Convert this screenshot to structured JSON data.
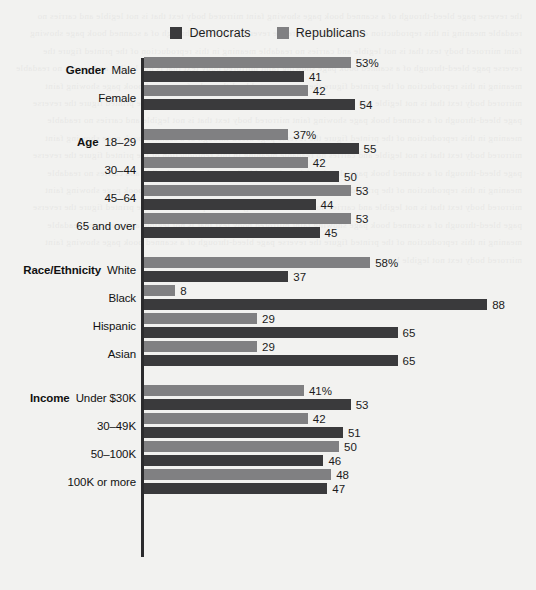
{
  "legend": {
    "items": [
      {
        "label": "Democrats",
        "color": "#3a3a3c",
        "icon": "legend-swatch-icon"
      },
      {
        "label": "Republicans",
        "color": "#808082",
        "icon": "legend-swatch-icon"
      }
    ]
  },
  "colors": {
    "democrats": "#3a3a3c",
    "republicans": "#808082",
    "axis": "#2b2b2d",
    "background": "#f2f2f0",
    "text": "#111111"
  },
  "ghost_text": "the reverse page bleed-through of a scanned book page showing faint mirrored body text that is not legible and carries no readable meaning in this reproduction of the printed figure the reverse page bleed-through of a scanned book page showing faint mirrored body text that is not legible and carries no readable meaning in this reproduction of the printed figure the reverse page bleed-through of a scanned book page showing faint mirrored body text that is not legible and carries no readable meaning in this reproduction of the printed figure the reverse page bleed-through of a scanned book page showing faint mirrored body text that is not legible and carries no readable meaning in this reproduction of the printed figure the reverse page bleed-through of a scanned book page showing faint mirrored body text that is not legible and carries no readable meaning in this reproduction of the printed figure the reverse page bleed-through of a scanned book page showing faint mirrored body text that is not legible and carries no readable meaning in this reproduction of the printed figure the reverse page bleed-through of a scanned book page showing faint mirrored body text that is not legible and carries no readable meaning in this reproduction of the printed figure the reverse page bleed-through of a scanned book page showing faint mirrored body text that is not legible and carries no readable meaning in this reproduction of the printed figure the reverse page bleed-through of a scanned book page showing faint mirrored body text that is not legible and carries no readable meaning in this reproduction of the printed figure the reverse page bleed-through of a scanned book page showing faint mirrored body text not legible here.",
  "chart_data": {
    "type": "bar",
    "orientation": "horizontal",
    "title": "",
    "xlabel": "",
    "ylabel": "",
    "xlim": [
      0,
      100
    ],
    "grid": false,
    "legend_position": "top-center",
    "series": [
      {
        "name": "Democrats",
        "color": "#3a3a3c"
      },
      {
        "name": "Republicans",
        "color": "#808082"
      }
    ],
    "groups": [
      {
        "name": "Gender",
        "categories": [
          {
            "label": "Male",
            "republicans": 53,
            "democrats": 41,
            "republicans_label": "53%",
            "democrats_label": "41"
          },
          {
            "label": "Female",
            "republicans": 42,
            "democrats": 54,
            "republicans_label": "42",
            "democrats_label": "54"
          }
        ]
      },
      {
        "name": "Age",
        "categories": [
          {
            "label": "18–29",
            "republicans": 37,
            "democrats": 55,
            "republicans_label": "37%",
            "democrats_label": "55"
          },
          {
            "label": "30–44",
            "republicans": 42,
            "democrats": 50,
            "republicans_label": "42",
            "democrats_label": "50"
          },
          {
            "label": "45–64",
            "republicans": 53,
            "democrats": 44,
            "republicans_label": "53",
            "democrats_label": "44"
          },
          {
            "label": "65 and over",
            "republicans": 53,
            "democrats": 45,
            "republicans_label": "53",
            "democrats_label": "45"
          }
        ]
      },
      {
        "name": "Race/Ethnicity",
        "categories": [
          {
            "label": "White",
            "republicans": 58,
            "democrats": 37,
            "republicans_label": "58%",
            "democrats_label": "37"
          },
          {
            "label": "Black",
            "republicans": 8,
            "democrats": 88,
            "republicans_label": "8",
            "democrats_label": "88"
          },
          {
            "label": "Hispanic",
            "republicans": 29,
            "democrats": 65,
            "republicans_label": "29",
            "democrats_label": "65"
          },
          {
            "label": "Asian",
            "republicans": 29,
            "democrats": 65,
            "republicans_label": "29",
            "democrats_label": "65"
          }
        ]
      },
      {
        "name": "Income",
        "categories": [
          {
            "label": "Under $30K",
            "republicans": 41,
            "democrats": 53,
            "republicans_label": "41%",
            "democrats_label": "53"
          },
          {
            "label": "30–49K",
            "republicans": 42,
            "democrats": 51,
            "republicans_label": "42",
            "democrats_label": "51"
          },
          {
            "label": "50–100K",
            "republicans": 50,
            "democrats": 46,
            "republicans_label": "50",
            "democrats_label": "46"
          },
          {
            "label": "100K or more",
            "republicans": 48,
            "democrats": 47,
            "republicans_label": "48",
            "democrats_label": "47"
          }
        ]
      }
    ]
  }
}
